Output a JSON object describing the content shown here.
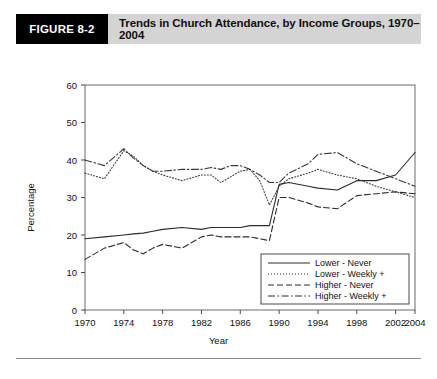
{
  "header": {
    "figure_tag": "FIGURE 8-2",
    "title": "Trends in Church Attendance, by Income Groups, 1970–2004"
  },
  "chart_data": {
    "type": "line",
    "title": "Trends in Church Attendance, by Income Groups, 1970–2004",
    "xlabel": "Year",
    "ylabel": "Percentage",
    "xlim": [
      1970,
      2004
    ],
    "ylim": [
      0,
      60
    ],
    "ytick_step": 10,
    "yticks": [
      0,
      10,
      20,
      30,
      40,
      50,
      60
    ],
    "xticks": [
      1970,
      1974,
      1978,
      1982,
      1986,
      1990,
      1994,
      1998,
      2002,
      2004
    ],
    "xtick_labels": [
      "1970",
      "1974",
      "1978",
      "1982",
      "1986",
      "1990",
      "1994",
      "1998",
      "2002",
      "2004"
    ],
    "ytick_labels": [
      "0",
      "10",
      "20",
      "30",
      "40",
      "50",
      "60"
    ],
    "grid": false,
    "legend_position": "inside-bottom-right",
    "x": [
      1970,
      1972,
      1974,
      1975,
      1976,
      1977,
      1978,
      1980,
      1982,
      1983,
      1984,
      1985,
      1986,
      1987,
      1988,
      1989,
      1990,
      1991,
      1993,
      1994,
      1996,
      1998,
      2000,
      2002,
      2004
    ],
    "series": [
      {
        "name": "Lower - Never",
        "style": "solid",
        "color": "#2b2b2b",
        "values": [
          19,
          19.5,
          20,
          20.3,
          20.5,
          21,
          21.5,
          22,
          21.5,
          22,
          22,
          22,
          22,
          22.5,
          22.5,
          22.5,
          33.5,
          34,
          33,
          32.5,
          32,
          34.5,
          34.5,
          36,
          42
        ]
      },
      {
        "name": "Lower - Weekly +",
        "style": "dotted",
        "color": "#3a3a3a",
        "values": [
          36.5,
          35,
          42.5,
          41,
          38.5,
          37,
          36,
          34.5,
          36,
          36,
          34,
          35.5,
          37,
          37.5,
          34.5,
          28,
          33,
          35,
          36.5,
          37.5,
          36,
          35,
          33,
          31.5,
          30
        ]
      },
      {
        "name": "Higher - Never",
        "style": "dashed",
        "color": "#2b2b2b",
        "values": [
          13.5,
          16.5,
          18,
          16,
          15,
          16.5,
          17.5,
          16.5,
          19.5,
          20,
          19.5,
          19.5,
          19.5,
          19.5,
          19,
          18.5,
          30,
          30,
          28.5,
          27.5,
          27,
          30.5,
          31,
          31.5,
          31
        ]
      },
      {
        "name": "Higher - Weekly +",
        "style": "dashdot",
        "color": "#3a3a3a",
        "values": [
          40,
          38.5,
          43,
          40.5,
          38.5,
          37,
          37,
          37.5,
          37.5,
          38,
          37.5,
          38.5,
          38.5,
          37.5,
          36,
          34,
          34,
          36.5,
          39,
          41.5,
          42,
          39,
          37,
          35,
          33
        ]
      }
    ],
    "legend": [
      {
        "label": "Lower - Never",
        "style": "solid"
      },
      {
        "label": "Lower - Weekly +",
        "style": "dotted"
      },
      {
        "label": "Higher - Never",
        "style": "dashed"
      },
      {
        "label": "Higher - Weekly +",
        "style": "dashdot"
      }
    ]
  }
}
